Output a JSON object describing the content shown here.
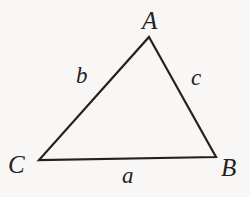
{
  "figure": {
    "kind": "geometry-diagram",
    "shape": "triangle",
    "background_color": "#f8f7f5",
    "stroke_color": "#25211f",
    "stroke_width": 2.2
  },
  "vertices": [
    {
      "id": "A",
      "label": "A",
      "x": 149,
      "y": 37
    },
    {
      "id": "B",
      "label": "B",
      "x": 216,
      "y": 157
    },
    {
      "id": "C",
      "label": "C",
      "x": 39,
      "y": 160
    }
  ],
  "sides": [
    {
      "id": "a",
      "label": "a",
      "between": "C-B"
    },
    {
      "id": "b",
      "label": "b",
      "between": "C-A"
    },
    {
      "id": "c",
      "label": "c",
      "between": "A-B"
    }
  ],
  "labels": {
    "vertex_A": "A",
    "vertex_B": "B",
    "vertex_C": "C",
    "side_a": "a",
    "side_b": "b",
    "side_c": "c"
  }
}
